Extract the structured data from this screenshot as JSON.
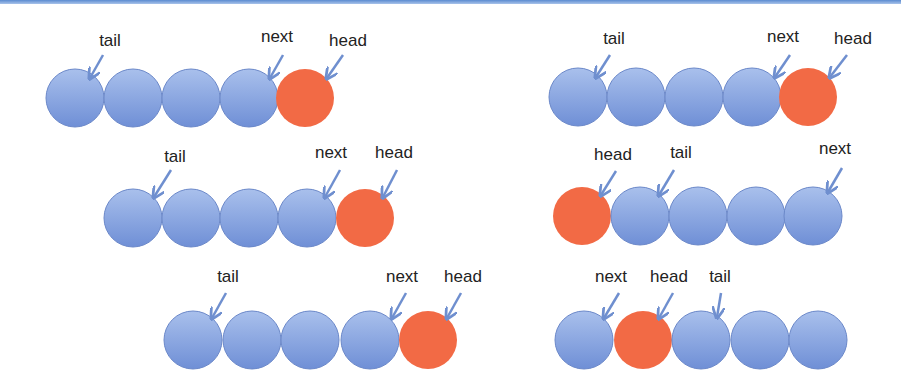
{
  "colors": {
    "node_fill_top": "#a9c0ec",
    "node_fill_bottom": "#6f8fd6",
    "node_stroke": "#6b88c9",
    "head_fill": "#f26a45",
    "arrow": "#6f8fcf",
    "border": "#5b8bd0"
  },
  "diagram": {
    "node_radius": 29,
    "panels": [
      {
        "id": "row1-left",
        "nodes": [
          {
            "cx": 75,
            "cy": 98,
            "type": "node"
          },
          {
            "cx": 133,
            "cy": 98,
            "type": "node"
          },
          {
            "cx": 191,
            "cy": 98,
            "type": "node"
          },
          {
            "cx": 249,
            "cy": 98,
            "type": "node"
          },
          {
            "cx": 305,
            "cy": 98,
            "type": "head"
          }
        ],
        "labels": [
          {
            "text": "tail",
            "x": 110,
            "y": 46,
            "ax": 103,
            "ay": 55,
            "tx": 90,
            "ty": 78
          },
          {
            "text": "next",
            "x": 277,
            "y": 42,
            "ax": 283,
            "ay": 55,
            "tx": 270,
            "ty": 78
          },
          {
            "text": "head",
            "x": 348,
            "y": 46,
            "ax": 343,
            "ay": 55,
            "tx": 327,
            "ty": 78
          }
        ]
      },
      {
        "id": "row1-right",
        "nodes": [
          {
            "cx": 578,
            "cy": 97,
            "type": "node"
          },
          {
            "cx": 636,
            "cy": 97,
            "type": "node"
          },
          {
            "cx": 694,
            "cy": 97,
            "type": "node"
          },
          {
            "cx": 752,
            "cy": 97,
            "type": "node"
          },
          {
            "cx": 808,
            "cy": 97,
            "type": "head"
          }
        ],
        "labels": [
          {
            "text": "tail",
            "x": 614,
            "y": 44,
            "ax": 610,
            "ay": 55,
            "tx": 596,
            "ty": 77
          },
          {
            "text": "next",
            "x": 783,
            "y": 42,
            "ax": 790,
            "ay": 55,
            "tx": 775,
            "ty": 77
          },
          {
            "text": "head",
            "x": 853,
            "y": 44,
            "ax": 847,
            "ay": 55,
            "tx": 830,
            "ty": 77
          }
        ]
      },
      {
        "id": "row2-left",
        "nodes": [
          {
            "cx": 133,
            "cy": 218,
            "type": "node"
          },
          {
            "cx": 191,
            "cy": 218,
            "type": "node"
          },
          {
            "cx": 249,
            "cy": 218,
            "type": "node"
          },
          {
            "cx": 307,
            "cy": 218,
            "type": "node"
          },
          {
            "cx": 365,
            "cy": 218,
            "type": "head"
          }
        ],
        "labels": [
          {
            "text": "tail",
            "x": 175,
            "y": 162,
            "ax": 171,
            "ay": 170,
            "tx": 154,
            "ty": 197
          },
          {
            "text": "next",
            "x": 331,
            "y": 158,
            "ax": 340,
            "ay": 170,
            "tx": 325,
            "ty": 197
          },
          {
            "text": "head",
            "x": 394,
            "y": 158,
            "ax": 397,
            "ay": 170,
            "tx": 383,
            "ty": 197
          }
        ]
      },
      {
        "id": "row2-right",
        "nodes": [
          {
            "cx": 582,
            "cy": 216,
            "type": "head"
          },
          {
            "cx": 640,
            "cy": 216,
            "type": "node"
          },
          {
            "cx": 698,
            "cy": 216,
            "type": "node"
          },
          {
            "cx": 756,
            "cy": 216,
            "type": "node"
          },
          {
            "cx": 813,
            "cy": 216,
            "type": "node"
          }
        ],
        "labels": [
          {
            "text": "head",
            "x": 613,
            "y": 160,
            "ax": 616,
            "ay": 171,
            "tx": 601,
            "ty": 195
          },
          {
            "text": "tail",
            "x": 681,
            "y": 158,
            "ax": 674,
            "ay": 170,
            "tx": 659,
            "ty": 195
          },
          {
            "text": "next",
            "x": 835,
            "y": 154,
            "ax": 842,
            "ay": 168,
            "tx": 828,
            "ty": 192
          }
        ]
      },
      {
        "id": "row3-left",
        "nodes": [
          {
            "cx": 193,
            "cy": 340,
            "type": "node"
          },
          {
            "cx": 252,
            "cy": 340,
            "type": "node"
          },
          {
            "cx": 310,
            "cy": 340,
            "type": "node"
          },
          {
            "cx": 370,
            "cy": 340,
            "type": "node"
          },
          {
            "cx": 428,
            "cy": 340,
            "type": "head"
          }
        ],
        "labels": [
          {
            "text": "tail",
            "x": 228,
            "y": 282,
            "ax": 226,
            "ay": 293,
            "tx": 212,
            "ty": 318
          },
          {
            "text": "next",
            "x": 402,
            "y": 282,
            "ax": 406,
            "ay": 293,
            "tx": 392,
            "ty": 318
          },
          {
            "text": "head",
            "x": 463,
            "y": 282,
            "ax": 461,
            "ay": 293,
            "tx": 447,
            "ty": 318
          }
        ]
      },
      {
        "id": "row3-right",
        "nodes": [
          {
            "cx": 584,
            "cy": 340,
            "type": "node"
          },
          {
            "cx": 643,
            "cy": 340,
            "type": "head"
          },
          {
            "cx": 701,
            "cy": 340,
            "type": "node"
          },
          {
            "cx": 760,
            "cy": 340,
            "type": "node"
          },
          {
            "cx": 818,
            "cy": 340,
            "type": "node"
          }
        ],
        "labels": [
          {
            "text": "next",
            "x": 611,
            "y": 282,
            "ax": 619,
            "ay": 293,
            "tx": 604,
            "ty": 318
          },
          {
            "text": "head",
            "x": 669,
            "y": 282,
            "ax": 673,
            "ay": 293,
            "tx": 659,
            "ty": 318
          },
          {
            "text": "tail",
            "x": 720,
            "y": 282,
            "ax": 721,
            "ay": 293,
            "tx": 717,
            "ty": 317
          }
        ]
      }
    ]
  }
}
